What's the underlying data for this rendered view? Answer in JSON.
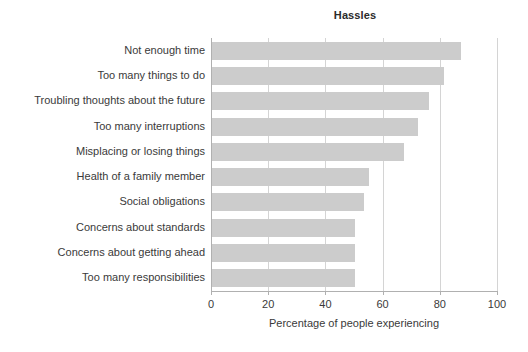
{
  "chart_data": {
    "type": "bar",
    "orientation": "horizontal",
    "title": "Hassles",
    "xlabel": "Percentage of people experiencing",
    "ylabel": "",
    "xlim": [
      0,
      100
    ],
    "xticks": [
      0,
      20,
      40,
      60,
      80,
      100
    ],
    "xtick_labels": [
      "0",
      "20",
      "40",
      "60",
      "80",
      "100"
    ],
    "grid": "vertical",
    "legend": "none",
    "bar_color": "#cccccc",
    "categories": [
      "Not enough time",
      "Too many things to do",
      "Troubling thoughts about the future",
      "Too many interruptions",
      "Misplacing or losing things",
      "Health of a family member",
      "Social obligations",
      "Concerns about standards",
      "Concerns about getting ahead",
      "Too many responsibilities"
    ],
    "values": [
      87,
      81,
      76,
      72,
      67,
      55,
      53,
      50,
      50,
      50
    ]
  },
  "colors": {
    "background": "#ffffff",
    "bar": "#cccccc",
    "axis": "#b0b0b0",
    "gridline": "#d4d4d4",
    "text": "#3a3a3a",
    "title_text": "#2b2b2b"
  }
}
